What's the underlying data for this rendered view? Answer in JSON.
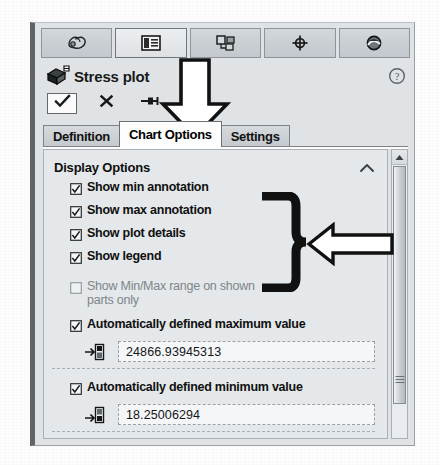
{
  "panel": {
    "title": "Stress plot",
    "title_icon": "stress-plot-icon",
    "help_icon": "help-question-icon",
    "icon_tabs": [
      {
        "name": "properties-icon",
        "selected": false
      },
      {
        "name": "list-details-icon",
        "selected": true
      },
      {
        "name": "assembly-icon",
        "selected": false
      },
      {
        "name": "crosshair-icon",
        "selected": false
      },
      {
        "name": "appearance-icon",
        "selected": false
      }
    ],
    "actions": [
      {
        "name": "accept-ok-button",
        "icon": "checkmark-icon",
        "framed": true
      },
      {
        "name": "cancel-button",
        "icon": "close-x-icon",
        "framed": false
      },
      {
        "name": "pin-button",
        "icon": "pushpin-icon",
        "framed": false
      }
    ],
    "tabs": [
      {
        "label": "Definition",
        "active": false
      },
      {
        "label": "Chart Options",
        "active": true
      },
      {
        "label": "Settings",
        "active": false
      }
    ]
  },
  "display_options": {
    "heading": "Display Options",
    "collapse_icon": "chevron-up-icon",
    "checkboxes": [
      {
        "label": "Show min annotation",
        "checked": true,
        "enabled": true
      },
      {
        "label": "Show max annotation",
        "checked": true,
        "enabled": true
      },
      {
        "label": "Show plot details",
        "checked": true,
        "enabled": true
      },
      {
        "label": "Show legend",
        "checked": true,
        "enabled": true
      },
      {
        "label": "Show Min/Max range on shown parts only",
        "checked": false,
        "enabled": false
      }
    ],
    "maximum": {
      "checkbox_label": "Automatically defined maximum value",
      "checked": true,
      "field_icon": "max-value-icon",
      "value": "24866.93945313"
    },
    "minimum": {
      "checkbox_label": "Automatically defined minimum value",
      "checked": true,
      "field_icon": "min-value-icon",
      "value": "18.25006294"
    }
  },
  "scrollbar": {
    "name": "vertical-scrollbar",
    "up_arrow_icon": "scroll-up-arrow-icon",
    "thumb_name": "scrollbar-thumb"
  },
  "annotations": [
    {
      "name": "annotation-arrow-down",
      "icon": "arrow-down-outline",
      "points_at": "Chart Options"
    },
    {
      "name": "annotation-brace",
      "icon": "curly-brace-right",
      "points_at": "display option checkboxes"
    },
    {
      "name": "annotation-arrow-left",
      "icon": "arrow-left-outline",
      "points_at": "display option checkboxes"
    }
  ],
  "colors": {
    "panel_background": "#dfe3e6",
    "content_background": "#e4e8ea",
    "active_tab": "#fdfdfd",
    "text": "#101010",
    "disabled_text": "#7e8589",
    "annotation_stroke": "#111111",
    "annotation_fill": "#ffffff"
  }
}
